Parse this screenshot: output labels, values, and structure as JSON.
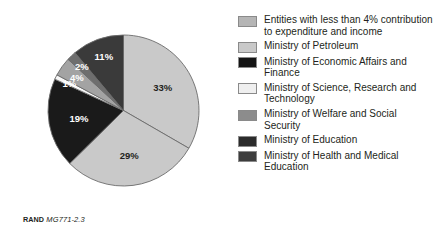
{
  "figure": {
    "caption_mark": "RAND",
    "caption_id": "MG771-2.3",
    "background_color": "#ffffff"
  },
  "chart_data": {
    "type": "pie",
    "title": "",
    "subtitle": "",
    "xlabel": "",
    "ylabel": "",
    "legend_position": "right",
    "grid": false,
    "start_angle_deg": 0,
    "direction": "clockwise",
    "categories": [
      "Ministry of Petroleum",
      "Entities with less than 4% contribution to expenditure and income",
      "Ministry of Economic Affairs and Finance",
      "Ministry of Science, Research and Technology",
      "Ministry of Welfare and Social Security",
      "Ministry of Education",
      "Ministry of Health and Medical Education"
    ],
    "values": [
      33,
      29,
      19,
      1,
      4,
      2,
      11
    ],
    "data_labels": [
      "33%",
      "29%",
      "19%",
      "1%",
      "4%",
      "2%",
      "11%"
    ],
    "colors": [
      "#c9c9c9",
      "#c9c9c9",
      "#1a1a1a",
      "#f7f7f7",
      "#a3a3a3",
      "#6e6e6e",
      "#3a3a3a"
    ],
    "slices": [
      {
        "label": "33%",
        "value": 33,
        "color": "#c9c9c9",
        "label_color": "#231f20",
        "legend_key": "Ministry of Petroleum"
      },
      {
        "label": "29%",
        "value": 29,
        "color": "#c9c9c9",
        "label_color": "#231f20",
        "legend_key": "Entities with less than 4% contribution to expenditure and income"
      },
      {
        "label": "19%",
        "value": 19,
        "color": "#1a1a1a",
        "label_color": "#ffffff",
        "legend_key": "Ministry of Economic Affairs and Finance"
      },
      {
        "label": "1%",
        "value": 1,
        "color": "#f7f7f7",
        "label_color": "#ffffff",
        "legend_key": "Ministry of Science, Research and Technology"
      },
      {
        "label": "4%",
        "value": 4,
        "color": "#a3a3a3",
        "label_color": "#ffffff",
        "legend_key": "Ministry of Welfare and Social Security"
      },
      {
        "label": "2%",
        "value": 2,
        "color": "#6e6e6e",
        "label_color": "#ffffff",
        "legend_key": "Ministry of Education"
      },
      {
        "label": "11%",
        "value": 11,
        "color": "#3a3a3a",
        "label_color": "#ffffff",
        "legend_key": "Ministry of Health and Medical Education"
      }
    ]
  },
  "legend": {
    "items": [
      {
        "label": "Entities with less than 4% contribution to expenditure and income",
        "color": "#b5b5b5"
      },
      {
        "label": "Ministry of Petroleum",
        "color": "#c9c9c9"
      },
      {
        "label": "Ministry of Economic Affairs and Finance",
        "color": "#141414"
      },
      {
        "label": "Ministry of Science, Research and Technology",
        "color": "#efefef"
      },
      {
        "label": "Ministry of Welfare and Social Security",
        "color": "#8c8c8c"
      },
      {
        "label": "Ministry of Education",
        "color": "#2b2b2b"
      },
      {
        "label": "Ministry of Health and Medical Education",
        "color": "#3d3d3d"
      }
    ]
  }
}
